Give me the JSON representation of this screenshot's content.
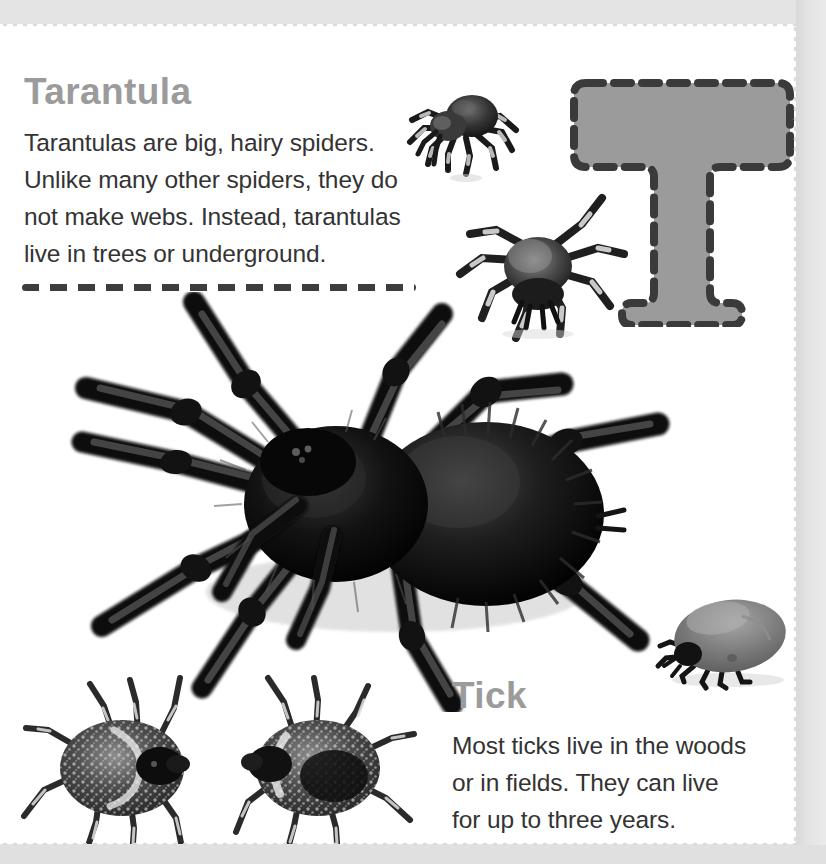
{
  "page": {
    "number": "23",
    "letter_graphic": "T",
    "background_color": "#e3e3e3",
    "sheet_color": "#ffffff"
  },
  "colors": {
    "heading": "#9b9b9b",
    "body_text": "#333333",
    "dash_rule": "#3d3d3d",
    "letter_fill": "#9b9b9b",
    "letter_outline": "#3a3a3a",
    "page_number": "#c4c4c4"
  },
  "sections": [
    {
      "heading": "Tarantula",
      "body_lines": [
        "Tarantulas are big, hairy spiders.",
        "Unlike many other spiders, they do",
        "not make webs. Instead, tarantulas",
        "live in trees or underground."
      ]
    },
    {
      "heading": "Tick",
      "body_lines": [
        "Most ticks live in the woods",
        "or in fields. They can live",
        "for up to three years."
      ]
    }
  ],
  "tarantula": {
    "heading": "Tarantula",
    "line1": "Tarantulas are big, hairy spiders.",
    "line2": "Unlike many other spiders, they do",
    "line3": "not make webs. Instead, tarantulas",
    "line4": "live in trees or underground."
  },
  "tick": {
    "heading": "Tick",
    "line1": "Most ticks live in the woods",
    "line2": "or in fields. They can live",
    "line3": "for up to three years."
  },
  "photos": [
    {
      "name": "tarantula-small-top",
      "caption": "small tarantula, side view, banded legs"
    },
    {
      "name": "tarantula-small-mid",
      "caption": "second tarantula, top view, banded legs"
    },
    {
      "name": "tarantula-large",
      "caption": "large black hairy tarantula, top view"
    },
    {
      "name": "tick-engorged",
      "caption": "engorged gray tick, side view"
    },
    {
      "name": "ticks-pair",
      "caption": "two mottled ticks facing each other, top view"
    }
  ],
  "icons": {
    "letter_t": "letter-t-tracing-icon"
  }
}
